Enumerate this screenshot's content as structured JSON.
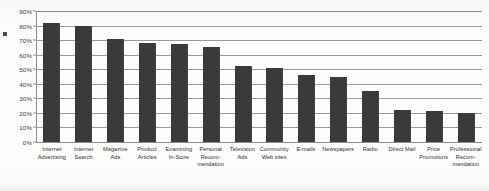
{
  "chart_data": {
    "type": "bar",
    "title": "",
    "subtitle": "",
    "xlabel": "",
    "ylabel": "",
    "ylim": [
      0,
      90
    ],
    "grid": true,
    "legend": false,
    "orientation": "vertical",
    "bar_color": "#3a3a3a",
    "gridline_color": "#9a9a98",
    "background_color": "#fdfdfc",
    "ytick_labels": [
      "90%",
      "80%",
      "70%",
      "60%",
      "50%",
      "40%",
      "30%",
      "20%",
      "10%",
      "0%"
    ],
    "ytick_values": [
      90,
      80,
      70,
      60,
      50,
      40,
      30,
      20,
      10,
      0
    ],
    "categories": [
      "Internet Advertising",
      "Internet Search",
      "Magazine Ads",
      "Product Articles",
      "Examining In-Store",
      "Personal Recom-mendation",
      "Television Ads",
      "Community Web sites",
      "E-mails",
      "Newspapers",
      "Radio",
      "Direct Mail",
      "Price Promotions",
      "Professional Recom-mendation"
    ],
    "category_lines": [
      [
        "Internet",
        "Advertising"
      ],
      [
        "Internet",
        "Search"
      ],
      [
        "Magazine",
        "Ads"
      ],
      [
        "Product",
        "Articles"
      ],
      [
        "Examining",
        "In-Store"
      ],
      [
        "Personal",
        "Recom-",
        "mendation"
      ],
      [
        "Television",
        "Ads"
      ],
      [
        "Community",
        "Web sites"
      ],
      [
        "E-mails"
      ],
      [
        "Newspapers"
      ],
      [
        "Radio"
      ],
      [
        "Direct Mail"
      ],
      [
        "Price",
        "Promotions"
      ],
      [
        "Professional",
        "Recom-",
        "mendation"
      ]
    ],
    "values": [
      82,
      80,
      71,
      68,
      67,
      65,
      52,
      51,
      46,
      45,
      35,
      22,
      21,
      20
    ]
  }
}
